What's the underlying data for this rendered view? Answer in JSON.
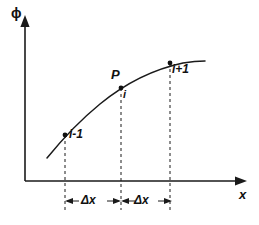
{
  "figure": {
    "kind": "finite-difference-stencil-diagram",
    "background_color": "#ffffff",
    "ink_color": "#111111"
  },
  "axes": {
    "y_label": "ϕ",
    "x_label": "x",
    "y_axis_name": "phi-axis",
    "x_axis_name": "x-axis",
    "origin": {
      "x": 25,
      "y": 181
    },
    "y_top": 17,
    "x_right": 246
  },
  "curve": {
    "name": "phi-curve",
    "shape": "concave-down monotonically increasing",
    "path": "M 47,158 C 60,142 78,122 100,104 C 122,86 150,70 183,63 C 192,61.5 199,61 205,61"
  },
  "nodes": [
    {
      "id": "i-minus-1",
      "label": "i-1",
      "x": 65,
      "y": 135,
      "label_x": 69,
      "label_y": 128,
      "dash_bottom": 210
    },
    {
      "id": "i",
      "label": "i",
      "x": 121,
      "y": 88,
      "label_x": 123,
      "label_y": 89,
      "dash_bottom": 210
    },
    {
      "id": "i-plus-1",
      "label": "i+1",
      "x": 170,
      "y": 63,
      "label_x": 172,
      "label_y": 63,
      "dash_bottom": 210
    }
  ],
  "point_label": {
    "name": "point-P",
    "text": "P",
    "x": 111,
    "y": 68
  },
  "spacings": [
    {
      "id": "delta-x-left",
      "label": "Δx",
      "from_x": 65,
      "to_x": 121,
      "y": 201,
      "label_x": 81,
      "label_y": 194
    },
    {
      "id": "delta-x-right",
      "label": "Δx",
      "from_x": 121,
      "to_x": 172,
      "y": 201,
      "label_x": 134,
      "label_y": 194
    }
  ],
  "chart_data": {
    "type": "line",
    "title": "",
    "xlabel": "x",
    "ylabel": "ϕ",
    "grid": false,
    "legend": null,
    "annotations": [
      "P",
      "i-1",
      "i",
      "i+1",
      "Δx",
      "Δx"
    ],
    "categories": [
      "i-1",
      "i",
      "i+1"
    ],
    "series": [
      {
        "name": "ϕ(x)",
        "values": [
          46,
          93,
          118
        ]
      }
    ]
  }
}
